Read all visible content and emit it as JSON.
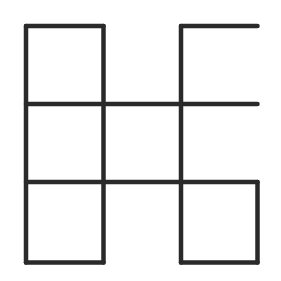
{
  "diagram": {
    "stroke_color": "#2a2a2a",
    "background": "#ffffff",
    "stroke_width": 4.5,
    "grid": {
      "xs": [
        26,
        103.5,
        181,
        257.5
      ],
      "ys": [
        26,
        104,
        182,
        262.5
      ]
    },
    "segments": [
      {
        "id": "top-left-top",
        "x1": 26,
        "y1": 26,
        "x2": 103.5,
        "y2": 26
      },
      {
        "id": "top-right-top",
        "x1": 181,
        "y1": 26,
        "x2": 257.5,
        "y2": 26
      },
      {
        "id": "row1-horizontal",
        "x1": 26,
        "y1": 104,
        "x2": 257.5,
        "y2": 104
      },
      {
        "id": "row2-horizontal",
        "x1": 26,
        "y1": 182,
        "x2": 257.5,
        "y2": 182
      },
      {
        "id": "bottom-left-bottom",
        "x1": 26,
        "y1": 262.5,
        "x2": 103.5,
        "y2": 262.5
      },
      {
        "id": "bottom-right-bottom",
        "x1": 181,
        "y1": 262.5,
        "x2": 257.5,
        "y2": 262.5
      },
      {
        "id": "col0-vertical",
        "x1": 26,
        "y1": 26,
        "x2": 26,
        "y2": 262.5
      },
      {
        "id": "col1-vertical",
        "x1": 103.5,
        "y1": 26,
        "x2": 103.5,
        "y2": 262.5
      },
      {
        "id": "col2-vertical",
        "x1": 181,
        "y1": 26,
        "x2": 181,
        "y2": 262.5
      },
      {
        "id": "col3-vertical",
        "x1": 257.5,
        "y1": 182,
        "x2": 257.5,
        "y2": 262.5
      }
    ]
  }
}
